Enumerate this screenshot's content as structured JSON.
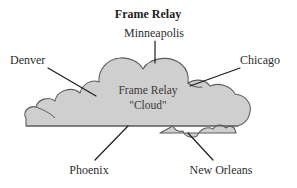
{
  "diagram": {
    "title": "Frame Relay",
    "cloud_label_line1": "Frame Relay",
    "cloud_label_line2": "\"Cloud\"",
    "nodes": [
      {
        "id": "minneapolis",
        "label": "Minneapolis",
        "position": "top"
      },
      {
        "id": "denver",
        "label": "Denver",
        "position": "left"
      },
      {
        "id": "chicago",
        "label": "Chicago",
        "position": "right"
      },
      {
        "id": "phoenix",
        "label": "Phoenix",
        "position": "bottom-left"
      },
      {
        "id": "new-orleans",
        "label": "New Orleans",
        "position": "bottom-right"
      }
    ],
    "colors": {
      "background": "#ffffff",
      "cloud_fill": "#cfcfcf",
      "cloud_stroke": "#5d5d5d",
      "leader_line": "#1d1d1d",
      "text": "#2e2e2e",
      "title_text": "#1c1c1c"
    }
  }
}
